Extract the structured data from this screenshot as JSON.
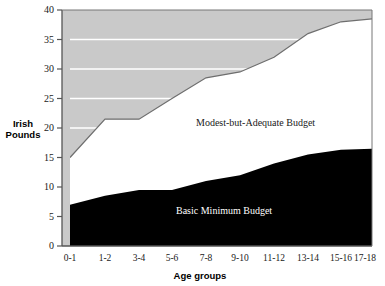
{
  "chart_data": {
    "type": "area",
    "stacked": true,
    "title": "",
    "xlabel": "Age groups",
    "ylabel": "Irish Pounds",
    "ylim": [
      0,
      40
    ],
    "yticks": [
      0,
      5,
      10,
      15,
      20,
      25,
      30,
      35,
      40
    ],
    "grid": true,
    "grid_color": "#ffffff",
    "plot_background": "#c9c9c9",
    "legend_position": "inline-labels",
    "categories": [
      "0-1",
      "1-2",
      "3-4",
      "5-6",
      "7-8",
      "9-10",
      "11-12",
      "13-14",
      "15-16",
      "17-18"
    ],
    "series": [
      {
        "name": "Basic Minimum Budget",
        "color": "#000000",
        "values": [
          7.0,
          8.5,
          9.5,
          9.5,
          11.0,
          12.0,
          14.0,
          15.5,
          16.3,
          16.5
        ]
      },
      {
        "name": "Modest-but-Adequate Budget",
        "color": "#c9c9c9",
        "cumulative_top_values": [
          15.0,
          21.5,
          21.5,
          25.0,
          28.5,
          29.5,
          32.0,
          36.0,
          38.0,
          38.5
        ],
        "values": [
          8.0,
          13.0,
          12.0,
          15.5,
          17.5,
          17.5,
          18.0,
          20.5,
          21.7,
          22.0
        ]
      }
    ],
    "annotations": [
      {
        "text": "Modest-but-Adequate Budget",
        "x": "7-8",
        "y": 22.5
      },
      {
        "text": "Basic Minimum Budget",
        "x": "7-8",
        "y": 7.0
      }
    ]
  },
  "axes": {
    "y_tick_labels": [
      "40",
      "35",
      "30",
      "25",
      "20",
      "15",
      "10",
      "5",
      "0"
    ],
    "x_tick_labels": [
      "0-1",
      "1-2",
      "3-4",
      "5-6",
      "7-8",
      "9-10",
      "11-12",
      "13-14",
      "15-16",
      "17-18"
    ],
    "y_axis_title": "Irish Pounds",
    "y_axis_title_line1": "Irish",
    "y_axis_title_line2": "Pounds",
    "x_axis_title": "Age groups"
  },
  "labels": {
    "modest": "Modest-but-Adequate Budget",
    "basic": "Basic Minimum Budget"
  },
  "colors": {
    "upper_band": "#c9c9c9",
    "lower_band": "#000000",
    "gap": "#ffffff",
    "axis": "#555555",
    "gridline": "#ffffff",
    "text": "#1a1a1a"
  }
}
